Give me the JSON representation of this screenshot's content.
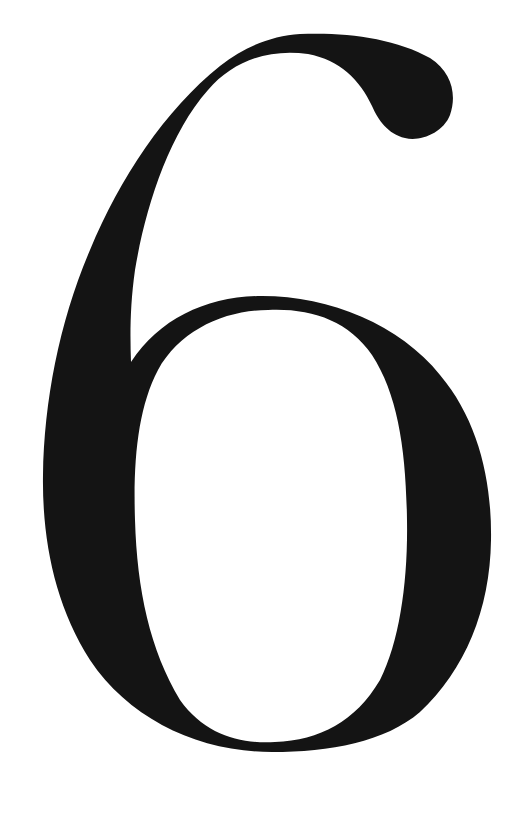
{
  "image": {
    "subject": "numeral",
    "character": "6",
    "style": "large serif numeral, black on white",
    "colors": {
      "background": "#ffffff",
      "glyph": "#141414"
    }
  }
}
